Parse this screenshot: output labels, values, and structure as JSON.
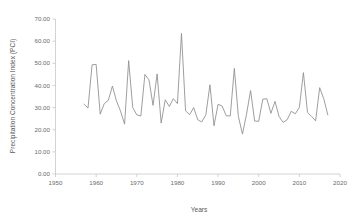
{
  "chart_data": {
    "type": "line",
    "title": "",
    "xlabel": "Years",
    "ylabel": "Precipitation Concentration Index (PCI)",
    "xlim": [
      1950,
      2020
    ],
    "ylim": [
      0,
      70
    ],
    "xticks": [
      1950,
      1960,
      1970,
      1980,
      1990,
      2000,
      2010,
      2020
    ],
    "xtick_labels": [
      "1950",
      "1960",
      "1970",
      "1980",
      "1990",
      "2000",
      "2010",
      "2020"
    ],
    "yticks": [
      0,
      10,
      20,
      30,
      40,
      50,
      60,
      70
    ],
    "ytick_labels": [
      "0.00",
      "10.00",
      "20.00",
      "30.00",
      "40.00",
      "50.00",
      "60.00",
      "70.00"
    ],
    "grid": false,
    "legend": false,
    "line_color": "#8d8d8d",
    "series": [
      {
        "name": "Precipitation Concentration Index",
        "x": [
          1957,
          1958,
          1959,
          1960,
          1961,
          1962,
          1963,
          1964,
          1965,
          1966,
          1967,
          1968,
          1969,
          1970,
          1971,
          1972,
          1973,
          1974,
          1975,
          1976,
          1977,
          1978,
          1979,
          1980,
          1981,
          1982,
          1983,
          1984,
          1985,
          1986,
          1987,
          1988,
          1989,
          1990,
          1991,
          1992,
          1993,
          1994,
          1995,
          1996,
          1997,
          1998,
          1999,
          2000,
          2001,
          2002,
          2003,
          2004,
          2005,
          2006,
          2007,
          2008,
          2009,
          2010,
          2011,
          2012,
          2013,
          2014,
          2015,
          2016,
          2017
        ],
        "values": [
          31.5,
          29.8,
          49.3,
          49.5,
          27.0,
          31.8,
          33.3,
          39.7,
          33.0,
          28.4,
          22.5,
          51.2,
          30.0,
          26.7,
          26.2,
          45.0,
          42.5,
          31.0,
          45.2,
          23.0,
          33.5,
          30.5,
          34.0,
          31.8,
          63.5,
          28.5,
          26.8,
          30.0,
          24.5,
          23.5,
          26.8,
          40.3,
          21.8,
          31.5,
          30.7,
          26.3,
          26.2,
          47.7,
          26.0,
          18.0,
          27.0,
          37.7,
          23.9,
          23.8,
          33.8,
          34.0,
          27.4,
          32.8,
          26.0,
          23.3,
          24.5,
          28.3,
          27.2,
          30.0,
          45.8,
          27.8,
          26.0,
          24.0,
          39.0,
          34.0,
          26.7
        ]
      }
    ]
  }
}
